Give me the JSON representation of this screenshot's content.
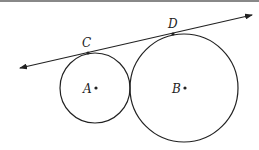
{
  "diagram": {
    "type": "geometry",
    "colors": {
      "stroke": "#222222",
      "border": "#888888",
      "background": "#ffffff"
    },
    "points": {
      "A": {
        "label": "A",
        "x": 95,
        "y": 88
      },
      "B": {
        "label": "B",
        "x": 184,
        "y": 88
      },
      "C": {
        "label": "C",
        "x": 88,
        "y": 53
      },
      "D": {
        "label": "D",
        "x": 173,
        "y": 34
      }
    },
    "circles": [
      {
        "center": "A",
        "r": 35
      },
      {
        "center": "B",
        "r": 54
      }
    ],
    "line": {
      "x1": 20,
      "y1": 68,
      "x2": 252,
      "y2": 15,
      "arrows": "both"
    }
  }
}
